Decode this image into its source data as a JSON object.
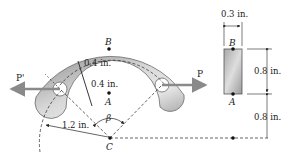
{
  "figure": {
    "type": "engineering-diagram",
    "colors": {
      "body_fill_light": "#e6e6e6",
      "body_fill_dark": "#9c9c9c",
      "line": "#222222",
      "arrow": "#8a8a8a",
      "background": "#ffffff"
    }
  },
  "labels": {
    "point_b": "B",
    "point_a": "A",
    "point_c": "C",
    "force_left": "P'",
    "force_right": "P",
    "angle": "β",
    "outer_thickness": "0.4 in.",
    "inner_thickness": "0.4 in.",
    "inner_radius": "1.2 in."
  },
  "cross_section": {
    "width": "0.3 in.",
    "height": "0.8 in.",
    "offset_to_center": "0.8 in.",
    "point_b": "B",
    "point_a": "A"
  }
}
